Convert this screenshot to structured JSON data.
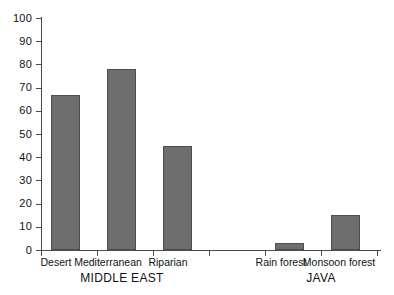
{
  "chart_data": {
    "type": "bar",
    "title": "",
    "subtitle": "",
    "xlabel": "",
    "ylabel": "",
    "ylim": [
      0,
      100
    ],
    "yticks": [
      0,
      10,
      20,
      30,
      40,
      50,
      60,
      70,
      80,
      90,
      100
    ],
    "ytick_labels": [
      "0",
      "10",
      "20",
      "30",
      "40",
      "50",
      "60",
      "70",
      "80",
      "90",
      "100"
    ],
    "grid": false,
    "legend": null,
    "bar_color": "#6e6e6e",
    "bar_edge_color": "#4e4e4e",
    "axis_color": "#4a4a4a",
    "background_color": "#ffffff",
    "categories": [
      "Desert",
      "Mediterranean",
      "Riparian",
      "Rain forest",
      "Monsoon forest"
    ],
    "values": [
      67,
      78,
      45,
      3,
      15
    ],
    "groups": [
      {
        "label": "MIDDLE EAST",
        "categories": [
          "Desert",
          "Mediterranean",
          "Riparian"
        ]
      },
      {
        "label": "JAVA",
        "categories": [
          "Rain forest",
          "Monsoon forest"
        ]
      }
    ],
    "bars": [
      {
        "label": "Desert",
        "value": 67,
        "group": "MIDDLE EAST"
      },
      {
        "label": "Mediterranean",
        "value": 78,
        "group": "MIDDLE EAST"
      },
      {
        "label": "Riparian",
        "value": 45,
        "group": "MIDDLE EAST"
      },
      {
        "label": "Rain forest",
        "value": 3,
        "group": "JAVA"
      },
      {
        "label": "Monsoon forest",
        "value": 15,
        "group": "JAVA"
      }
    ]
  },
  "axis": {
    "y_labels": [
      "100",
      "90",
      "80",
      "70",
      "60",
      "50",
      "40",
      "30",
      "20",
      "10",
      "0"
    ]
  },
  "categories": {
    "c0": "Desert",
    "c1": "Mediterranean",
    "c2": "Riparian",
    "c3": "Rain forest",
    "c4": "Monsoon forest"
  },
  "groups": {
    "g0": "MIDDLE EAST",
    "g1": "JAVA"
  }
}
